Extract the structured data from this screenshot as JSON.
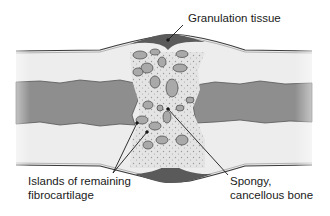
{
  "diagram": {
    "labels": {
      "granulation": "Granulation tissue",
      "islands_line1": "Islands of remaining",
      "islands_line2": "fibrocartilage",
      "spongy_line1": "Spongy,",
      "spongy_line2": "cancellous bone"
    },
    "colors": {
      "cortex": "#ececec",
      "marrow": "#8c8c8c",
      "callus": "#e2e2e2",
      "granulation": "#5a5a5a",
      "island": "#a9a9a9",
      "outline": "#3a3a3a"
    }
  }
}
